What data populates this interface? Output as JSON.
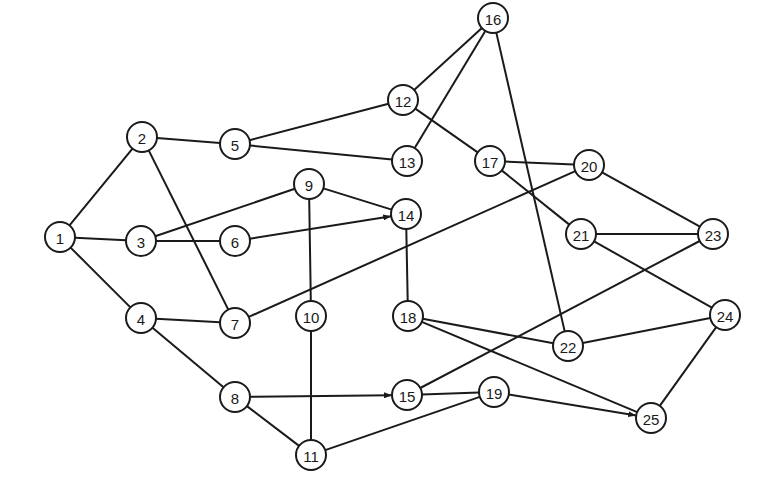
{
  "diagram": {
    "type": "network-graph",
    "node_radius": 15,
    "colors": {
      "stroke": "#1a1a1a",
      "fill": "#ffffff",
      "background": "#ffffff"
    },
    "nodes": [
      {
        "id": "1",
        "x": 60,
        "y": 237
      },
      {
        "id": "2",
        "x": 142,
        "y": 137
      },
      {
        "id": "3",
        "x": 141,
        "y": 241
      },
      {
        "id": "4",
        "x": 141,
        "y": 318
      },
      {
        "id": "5",
        "x": 235,
        "y": 144
      },
      {
        "id": "6",
        "x": 235,
        "y": 241
      },
      {
        "id": "7",
        "x": 235,
        "y": 323
      },
      {
        "id": "8",
        "x": 235,
        "y": 397
      },
      {
        "id": "9",
        "x": 309,
        "y": 184
      },
      {
        "id": "10",
        "x": 311,
        "y": 316
      },
      {
        "id": "11",
        "x": 311,
        "y": 455
      },
      {
        "id": "12",
        "x": 403,
        "y": 100
      },
      {
        "id": "13",
        "x": 407,
        "y": 161
      },
      {
        "id": "14",
        "x": 406,
        "y": 214
      },
      {
        "id": "15",
        "x": 407,
        "y": 395
      },
      {
        "id": "16",
        "x": 493,
        "y": 18
      },
      {
        "id": "17",
        "x": 490,
        "y": 161
      },
      {
        "id": "18",
        "x": 408,
        "y": 316
      },
      {
        "id": "19",
        "x": 494,
        "y": 392
      },
      {
        "id": "20",
        "x": 589,
        "y": 165
      },
      {
        "id": "21",
        "x": 581,
        "y": 234
      },
      {
        "id": "22",
        "x": 568,
        "y": 346
      },
      {
        "id": "23",
        "x": 713,
        "y": 234
      },
      {
        "id": "24",
        "x": 725,
        "y": 315
      },
      {
        "id": "25",
        "x": 651,
        "y": 418
      }
    ],
    "edges": [
      {
        "from": "1",
        "to": "2"
      },
      {
        "from": "1",
        "to": "3"
      },
      {
        "from": "1",
        "to": "4"
      },
      {
        "from": "2",
        "to": "5"
      },
      {
        "from": "2",
        "to": "7"
      },
      {
        "from": "3",
        "to": "6"
      },
      {
        "from": "3",
        "to": "9"
      },
      {
        "from": "4",
        "to": "7"
      },
      {
        "from": "4",
        "to": "8"
      },
      {
        "from": "5",
        "to": "12"
      },
      {
        "from": "5",
        "to": "13"
      },
      {
        "from": "6",
        "to": "14",
        "arrow": true
      },
      {
        "from": "7",
        "to": "20"
      },
      {
        "from": "8",
        "to": "15",
        "arrow": true
      },
      {
        "from": "8",
        "to": "11"
      },
      {
        "from": "9",
        "to": "14"
      },
      {
        "from": "9",
        "to": "10"
      },
      {
        "from": "10",
        "to": "11"
      },
      {
        "from": "11",
        "to": "19"
      },
      {
        "from": "12",
        "to": "16"
      },
      {
        "from": "12",
        "to": "17"
      },
      {
        "from": "13",
        "to": "16"
      },
      {
        "from": "14",
        "to": "18"
      },
      {
        "from": "15",
        "to": "19"
      },
      {
        "from": "15",
        "to": "23"
      },
      {
        "from": "16",
        "to": "22"
      },
      {
        "from": "17",
        "to": "20"
      },
      {
        "from": "17",
        "to": "21"
      },
      {
        "from": "18",
        "to": "22"
      },
      {
        "from": "18",
        "to": "25"
      },
      {
        "from": "19",
        "to": "25",
        "arrow": true
      },
      {
        "from": "20",
        "to": "23"
      },
      {
        "from": "21",
        "to": "23"
      },
      {
        "from": "21",
        "to": "24"
      },
      {
        "from": "22",
        "to": "24"
      },
      {
        "from": "24",
        "to": "25"
      }
    ]
  }
}
